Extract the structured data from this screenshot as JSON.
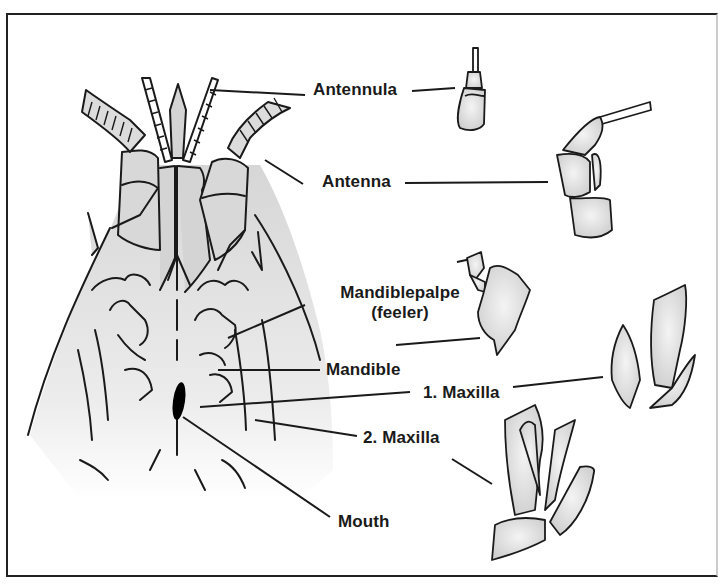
{
  "diagram": {
    "type": "anatomical-labeled-illustration",
    "colors": {
      "outline": "#1a1a1a",
      "fill": "#dcdcdc",
      "background": "#ffffff",
      "frame": "#222222"
    },
    "labels": [
      {
        "id": "antennula",
        "text": "Antennula"
      },
      {
        "id": "antenna",
        "text": "Antenna"
      },
      {
        "id": "mandiblepalpe",
        "text": "Mandiblepalpe",
        "subtext": "(feeler)"
      },
      {
        "id": "mandible",
        "text": "Mandible"
      },
      {
        "id": "maxilla1",
        "text": "1. Maxilla"
      },
      {
        "id": "maxilla2",
        "text": "2. Maxilla"
      },
      {
        "id": "mouth",
        "text": "Mouth"
      }
    ]
  }
}
